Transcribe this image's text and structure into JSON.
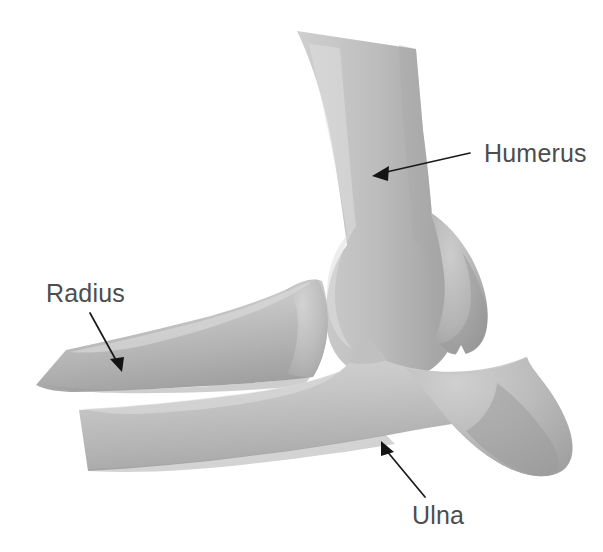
{
  "figure": {
    "background_color": "#ffffff",
    "bone_fill_light": "#d2d2d2",
    "bone_fill_mid": "#b9b9b9",
    "bone_fill_dark": "#9a9a9a",
    "label_color": "#4d4d4d",
    "arrow_color": "#141414",
    "joint_space_color": "#ffffff"
  },
  "labels": [
    {
      "id": "humerus",
      "text": "Humerus",
      "text_x": 484,
      "text_y": 162,
      "anchor": "start",
      "arrow_tail_x": 470,
      "arrow_tail_y": 153,
      "arrow_tip_x": 372,
      "arrow_tip_y": 176
    },
    {
      "id": "radius",
      "text": "Radius",
      "text_x": 46,
      "text_y": 302,
      "anchor": "start",
      "arrow_tail_x": 90,
      "arrow_tail_y": 313,
      "arrow_tip_x": 122,
      "arrow_tip_y": 372
    },
    {
      "id": "ulna",
      "text": "Ulna",
      "text_x": 412,
      "text_y": 524,
      "anchor": "start",
      "arrow_tail_x": 425,
      "arrow_tail_y": 497,
      "arrow_tip_x": 381,
      "arrow_tip_y": 441
    }
  ],
  "bones": [
    {
      "id": "humerus",
      "name": "Humerus",
      "description": "Upper arm bone, shaft descending from top of image widening into the distal condyle with a lateral epicondyle bulge on the right."
    },
    {
      "id": "radius",
      "name": "Radius",
      "description": "Upper forearm bone, tapering to a point at the left and rising to the radial head near the joint."
    },
    {
      "id": "ulna",
      "name": "Ulna",
      "description": "Lower forearm bone, shaft from the left widening into the large olecranon process at the right."
    }
  ]
}
